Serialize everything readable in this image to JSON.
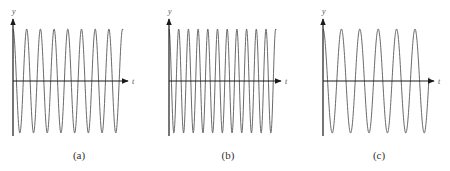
{
  "figure": {
    "panels": [
      {
        "id": "a",
        "caption": "(a)",
        "y_label": "y",
        "x_label": "t",
        "origin": [
          13,
          81
        ],
        "y_axis_top": 19,
        "y_axis_bottom": 136,
        "x_axis_end": 128,
        "amplitude": 52,
        "period_px": 13.7,
        "phase": "cos",
        "t_end": 123,
        "caption_pos": [
          79,
          159
        ]
      },
      {
        "id": "b",
        "caption": "(b)",
        "y_label": "y",
        "x_label": "t",
        "origin": [
          169,
          81
        ],
        "y_axis_top": 19,
        "y_axis_bottom": 136,
        "x_axis_end": 281,
        "amplitude": 52,
        "period_px": 9.7,
        "phase": "cos",
        "t_end": 276,
        "caption_pos": [
          228,
          159
        ]
      },
      {
        "id": "c",
        "caption": "(c)",
        "y_label": "y",
        "x_label": "t",
        "origin": [
          323,
          81
        ],
        "y_axis_top": 19,
        "y_axis_bottom": 136,
        "x_axis_end": 434,
        "amplitude": 52,
        "period_px": 18.4,
        "phase": "cos",
        "t_end": 429,
        "caption_pos": [
          379,
          159
        ]
      }
    ]
  },
  "chart_data": [
    {
      "type": "line",
      "title": "(a)",
      "xlabel": "t",
      "ylabel": "y",
      "series": [
        {
          "name": "y = A cos(ωt)",
          "cycles_visible": 8.4,
          "relative_frequency": "medium"
        }
      ],
      "grid": false
    },
    {
      "type": "line",
      "title": "(b)",
      "xlabel": "t",
      "ylabel": "y",
      "series": [
        {
          "name": "y = A cos(ωt)",
          "cycles_visible": 11.3,
          "relative_frequency": "high"
        }
      ],
      "grid": false
    },
    {
      "type": "line",
      "title": "(c)",
      "xlabel": "t",
      "ylabel": "y",
      "series": [
        {
          "name": "y = A cos(ωt)",
          "cycles_visible": 5.8,
          "relative_frequency": "low"
        }
      ],
      "grid": false
    }
  ]
}
